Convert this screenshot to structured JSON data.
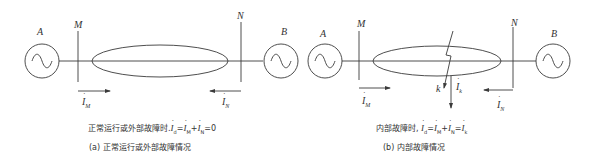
{
  "diagrams": [
    {
      "id": "a",
      "labels": {
        "gen_a": "A",
        "bus_m": "M",
        "bus_n": "N",
        "gen_b": "B"
      },
      "currents": {
        "i_m": {
          "symbol": "I",
          "sub": "M",
          "direction": "right"
        },
        "i_n": {
          "symbol": "I",
          "sub": "N",
          "direction": "left"
        }
      },
      "equation": {
        "prefix": "正常运行或外部故障时.",
        "terms": [
          {
            "symbol": "I",
            "sub": "d"
          },
          {
            "op": "="
          },
          {
            "symbol": "I",
            "sub": "M"
          },
          {
            "op": "+"
          },
          {
            "symbol": "I",
            "sub": "N"
          },
          {
            "op": "=0"
          }
        ],
        "text": "İd=İM+İN=0"
      },
      "caption": "(a) 正常运行或外部故障情况"
    },
    {
      "id": "b",
      "labels": {
        "gen_a": "A",
        "bus_m": "M",
        "bus_n": "N",
        "gen_b": "B",
        "fault": "k"
      },
      "currents": {
        "i_m": {
          "symbol": "I",
          "sub": "M",
          "direction": "right"
        },
        "i_n": {
          "symbol": "I",
          "sub": "N",
          "direction": "left"
        },
        "i_k": {
          "symbol": "I",
          "sub": "k",
          "direction": "down"
        }
      },
      "equation": {
        "prefix": "内部故障时, ",
        "terms": [
          {
            "symbol": "I",
            "sub": "d"
          },
          {
            "op": "="
          },
          {
            "symbol": "I",
            "sub": "M"
          },
          {
            "op": "+"
          },
          {
            "symbol": "I",
            "sub": "N"
          },
          {
            "op": "="
          },
          {
            "symbol": "I",
            "sub": "k"
          }
        ],
        "text": "İd=İM+İN=İk"
      },
      "caption": "(b) 内部故障情况"
    }
  ],
  "colors": {
    "stroke": "#3a3a3a",
    "background": "#ffffff"
  }
}
